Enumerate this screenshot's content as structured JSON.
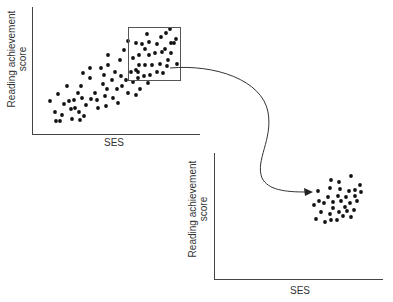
{
  "chart_data": [
    {
      "type": "scatter",
      "title": "",
      "xlabel": "SES",
      "ylabel": "Reading achievement score",
      "grid": false,
      "legend": null,
      "description": "Full-range scatter showing positive correlation between SES and reading achievement; a rectangular box highlights the high-SES, high-score region.",
      "highlight_box": {
        "x0": 128,
        "y0": 27,
        "x1": 180,
        "y1": 80
      },
      "points_px": [
        [
          50,
          101
        ],
        [
          55,
          112
        ],
        [
          56,
          121
        ],
        [
          60,
          121
        ],
        [
          58,
          94
        ],
        [
          62,
          115
        ],
        [
          64,
          104
        ],
        [
          67,
          86
        ],
        [
          69,
          101
        ],
        [
          71,
          109
        ],
        [
          72,
          119
        ],
        [
          75,
          108
        ],
        [
          74,
          100
        ],
        [
          78,
          93
        ],
        [
          80,
          120
        ],
        [
          79,
          112
        ],
        [
          81,
          86
        ],
        [
          82,
          98
        ],
        [
          84,
          116
        ],
        [
          86,
          105
        ],
        [
          83,
          73
        ],
        [
          90,
          68
        ],
        [
          90,
          78
        ],
        [
          91,
          99
        ],
        [
          95,
          93
        ],
        [
          97,
          100
        ],
        [
          98,
          108
        ],
        [
          101,
          68
        ],
        [
          103,
          84
        ],
        [
          104,
          75
        ],
        [
          105,
          96
        ],
        [
          106,
          106
        ],
        [
          107,
          89
        ],
        [
          108,
          55
        ],
        [
          108,
          65
        ],
        [
          112,
          80
        ],
        [
          113,
          98
        ],
        [
          115,
          72
        ],
        [
          117,
          89
        ],
        [
          118,
          103
        ],
        [
          120,
          60
        ],
        [
          121,
          76
        ],
        [
          122,
          86
        ],
        [
          124,
          50
        ],
        [
          126,
          80
        ],
        [
          128,
          93
        ],
        [
          131,
          72
        ],
        [
          133,
          82
        ],
        [
          136,
          95
        ],
        [
          138,
          72
        ],
        [
          140,
          89
        ],
        [
          142,
          44
        ],
        [
          148,
          83
        ],
        [
          149,
          55
        ],
        [
          128,
          41
        ],
        [
          133,
          58
        ],
        [
          136,
          43
        ],
        [
          139,
          55
        ],
        [
          139,
          65
        ],
        [
          136,
          70
        ],
        [
          145,
          65
        ],
        [
          145,
          49
        ],
        [
          147,
          34
        ],
        [
          149,
          42
        ],
        [
          152,
          65
        ],
        [
          155,
          53
        ],
        [
          157,
          44
        ],
        [
          162,
          52
        ],
        [
          160,
          64
        ],
        [
          161,
          37
        ],
        [
          165,
          49
        ],
        [
          166,
          33
        ],
        [
          163,
          73
        ],
        [
          157,
          72
        ],
        [
          150,
          75
        ],
        [
          144,
          76
        ],
        [
          168,
          60
        ],
        [
          167,
          66
        ],
        [
          171,
          43
        ],
        [
          174,
          43
        ],
        [
          176,
          39
        ],
        [
          171,
          53
        ],
        [
          170,
          29
        ],
        [
          177,
          64
        ],
        [
          138,
          78
        ]
      ]
    },
    {
      "type": "scatter",
      "title": "",
      "xlabel": "SES",
      "ylabel": "Reading achievement score",
      "grid": false,
      "legend": null,
      "description": "Restricted-range scatter: only the boxed high-SES subset, showing little correlation.",
      "points_px": [
        [
          331,
          180
        ],
        [
          339,
          182
        ],
        [
          351,
          176
        ],
        [
          318,
          191
        ],
        [
          330,
          188
        ],
        [
          340,
          189
        ],
        [
          349,
          191
        ],
        [
          355,
          190
        ],
        [
          360,
          185
        ],
        [
          319,
          201
        ],
        [
          328,
          197
        ],
        [
          338,
          196
        ],
        [
          346,
          197
        ],
        [
          355,
          196
        ],
        [
          361,
          192
        ],
        [
          314,
          205
        ],
        [
          324,
          203
        ],
        [
          333,
          202
        ],
        [
          341,
          201
        ],
        [
          350,
          203
        ],
        [
          357,
          201
        ],
        [
          321,
          212
        ],
        [
          330,
          214
        ],
        [
          339,
          212
        ],
        [
          347,
          211
        ],
        [
          354,
          210
        ],
        [
          316,
          219
        ],
        [
          325,
          222
        ],
        [
          331,
          220
        ],
        [
          337,
          220
        ],
        [
          343,
          216
        ],
        [
          351,
          217
        ],
        [
          345,
          207
        ],
        [
          333,
          208
        ]
      ]
    }
  ],
  "labels": {
    "chart1_x": "SES",
    "chart1_y_line1": "Reading achievement",
    "chart1_y_line2": "score",
    "chart2_x": "SES",
    "chart2_y_line1": "Reading achievement",
    "chart2_y_line2": "score"
  },
  "colors": {
    "dot": "#111111",
    "axis": "#444444",
    "box": "#555555",
    "arrow": "#333333"
  }
}
